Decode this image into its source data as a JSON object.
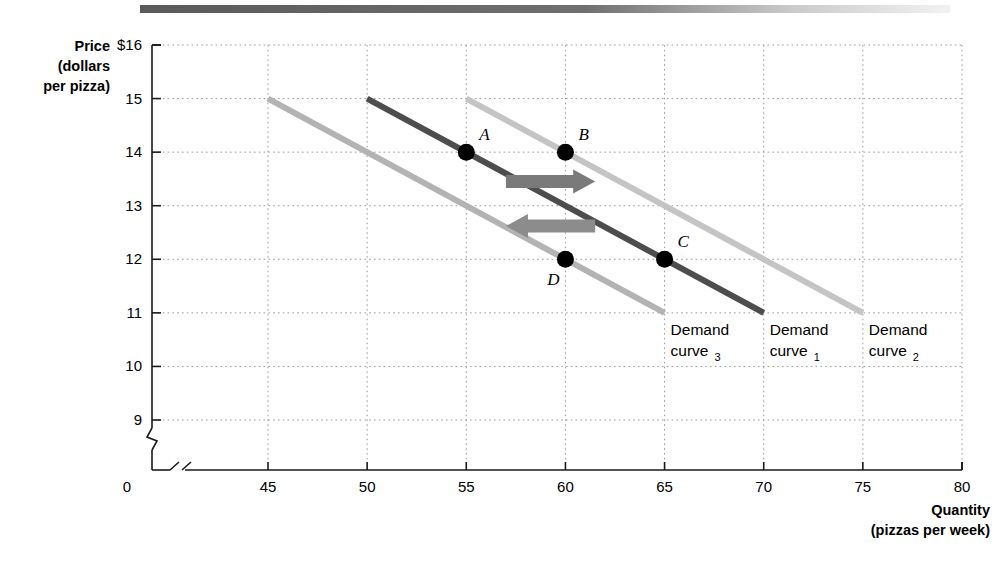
{
  "figure": {
    "y_axis_title_lines": [
      "Price",
      "(dollars",
      "per pizza)"
    ],
    "x_axis_title_lines": [
      "Quantity",
      "(pizzas per week)"
    ],
    "origin_label": "0"
  },
  "chart_data": {
    "type": "line",
    "title": "",
    "xlabel": "Quantity (pizzas per week)",
    "ylabel": "Price (dollars per pizza)",
    "xlim": [
      42,
      80
    ],
    "ylim": [
      8.6,
      16
    ],
    "grid": true,
    "axis_break_x": true,
    "axis_break_y": true,
    "xticks": [
      "45",
      "50",
      "55",
      "60",
      "65",
      "70",
      "75",
      "80"
    ],
    "xtick_values": [
      45,
      50,
      55,
      60,
      65,
      70,
      75,
      80
    ],
    "yticks": [
      "$16",
      "15",
      "14",
      "13",
      "12",
      "11",
      "10",
      "9"
    ],
    "ytick_values": [
      16,
      15,
      14,
      13,
      12,
      11,
      10,
      9
    ],
    "series": [
      {
        "name": "Demand curve3",
        "label_main": "Demand",
        "label_sub": "3",
        "color": "#b3b3b3",
        "x": [
          45,
          65
        ],
        "y": [
          15,
          11
        ],
        "label_x": 65,
        "label_y": 11
      },
      {
        "name": "Demand curve1",
        "label_main": "Demand",
        "label_sub": "1",
        "color": "#4d4d4d",
        "x": [
          50,
          70
        ],
        "y": [
          15,
          11
        ],
        "label_x": 70,
        "label_y": 11
      },
      {
        "name": "Demand curve2",
        "label_main": "Demand",
        "label_sub": "2",
        "color": "#c4c4c4",
        "x": [
          55,
          75
        ],
        "y": [
          15,
          11
        ],
        "label_x": 75,
        "label_y": 11
      }
    ],
    "points": [
      {
        "label": "A",
        "x": 55,
        "y": 14,
        "label_pos": "upper-right"
      },
      {
        "label": "B",
        "x": 60,
        "y": 14,
        "label_pos": "upper-right"
      },
      {
        "label": "C",
        "x": 65,
        "y": 12,
        "label_pos": "upper-right"
      },
      {
        "label": "D",
        "x": 60,
        "y": 12,
        "label_pos": "lower-left"
      }
    ],
    "annotations": [
      {
        "name": "increase-in-demand-arrow",
        "direction": "right",
        "x_from": 57.0,
        "x_to": 61.5,
        "y": 13.45,
        "color": "#7a7a7a"
      },
      {
        "name": "decrease-in-demand-arrow",
        "direction": "left",
        "x_from": 61.5,
        "x_to": 57.0,
        "y": 12.62,
        "color": "#8c8c8c"
      }
    ]
  },
  "colors": {
    "curve_dark": "#4d4d4d",
    "curve_light": "#b3b3b3",
    "curve_light2": "#c4c4c4",
    "point": "#000000",
    "grid": "#9a9a9a",
    "axis": "#1a1a1a",
    "topbar": "#5a5a5a"
  }
}
